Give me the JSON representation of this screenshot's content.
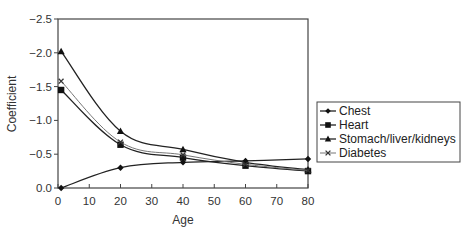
{
  "chart_data": {
    "type": "line",
    "title": "",
    "xlabel": "Age",
    "ylabel": "Coefficient",
    "xlim": [
      0,
      80
    ],
    "ylim": [
      0.0,
      -2.5
    ],
    "y_axis_inverted": true,
    "grid": false,
    "legend_position": "right",
    "x_ticks": [
      "0",
      "10",
      "20",
      "30",
      "40",
      "50",
      "60",
      "70",
      "80"
    ],
    "y_ticks": [
      "-2.5",
      "-2.0",
      "-1.5",
      "-1.0",
      "-0.5",
      "0.0"
    ],
    "x": [
      1,
      20,
      40,
      60,
      80
    ],
    "series": [
      {
        "name": "Chest",
        "marker": "diamond",
        "values": [
          0.0,
          -0.3,
          -0.38,
          -0.4,
          -0.43
        ]
      },
      {
        "name": "Heart",
        "marker": "square",
        "values": [
          -1.45,
          -0.64,
          -0.45,
          -0.33,
          -0.25
        ]
      },
      {
        "name": "Stomach/liver/kidneys",
        "marker": "triangle",
        "values": [
          -2.02,
          -0.84,
          -0.57,
          -0.38,
          -0.27
        ]
      },
      {
        "name": "Diabetes",
        "marker": "x",
        "values": [
          -1.58,
          -0.68,
          -0.49,
          -0.35,
          -0.26
        ]
      }
    ]
  },
  "legend": {
    "items": [
      "Chest",
      "Heart",
      "Stomach/liver/kidneys",
      "Diabetes"
    ]
  },
  "axes": {
    "x_title": "Age",
    "y_title": "Coefficient"
  }
}
